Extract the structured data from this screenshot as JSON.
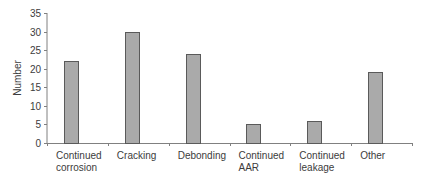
{
  "chart_data": {
    "type": "bar",
    "title": "",
    "xlabel": "",
    "ylabel": "Number",
    "categories": [
      [
        "Continued",
        "corrosion"
      ],
      [
        "Cracking"
      ],
      [
        "Debonding"
      ],
      [
        "Continued",
        "AAR"
      ],
      [
        "Continued",
        "leakage"
      ],
      [
        "Other"
      ]
    ],
    "category_names": [
      "Continued corrosion",
      "Cracking",
      "Debonding",
      "Continued AAR",
      "Continued leakage",
      "Other"
    ],
    "values": [
      22,
      30,
      24,
      5,
      6,
      19
    ],
    "ylim": [
      0,
      35
    ],
    "yticks": [
      0,
      5,
      10,
      15,
      20,
      25,
      30,
      35
    ],
    "grid": false,
    "legend": null,
    "colors": {
      "bar_fill": "#aaaaaa",
      "bar_stroke": "#5a5a5a",
      "axis": "#808080"
    }
  }
}
